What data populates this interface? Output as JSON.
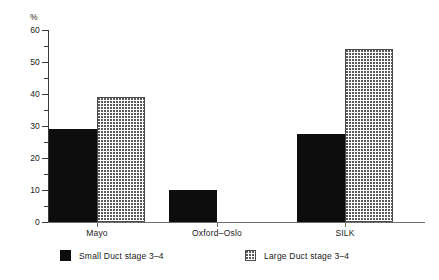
{
  "chart_data": {
    "type": "bar",
    "title": "",
    "xlabel": "",
    "ylabel": "%",
    "ylim": [
      0,
      60
    ],
    "ytick_step": 10,
    "yminor_step": 5,
    "grid": false,
    "legend_position": "bottom",
    "categories": [
      "Mayo",
      "Oxford–Oslo",
      "SILK"
    ],
    "ytick_labels": [
      "0",
      "10",
      "20",
      "30",
      "40",
      "50",
      "60"
    ],
    "series": [
      {
        "name": "Small Duct stage 3–4",
        "fill": "solid-black",
        "color": "#0d0d0d",
        "values": [
          29,
          10,
          27.5
        ]
      },
      {
        "name": "Large Duct  stage 3–4",
        "fill": "dotted",
        "color": "#5a5a5a",
        "values": [
          39,
          null,
          54
        ]
      }
    ]
  },
  "legend": {
    "items": [
      {
        "label": "Small Duct stage 3–4",
        "swatch": "solid"
      },
      {
        "label": "Large Duct  stage 3–4",
        "swatch": "dotted"
      }
    ]
  },
  "caption": {
    "text": ""
  }
}
